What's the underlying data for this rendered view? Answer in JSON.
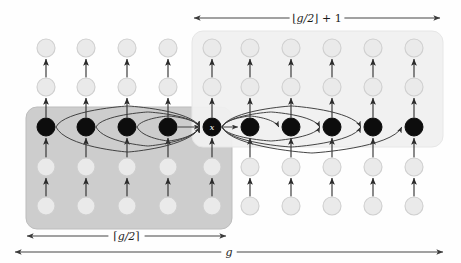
{
  "figure": {
    "background": "#fefefe"
  },
  "colors": {
    "dark_box_fill": "#c9c9c9",
    "dark_box_stroke": "#bdbdbd",
    "light_box_fill": "#f0f0f0",
    "light_box_stroke": "#e6e6e6",
    "active_node_fill": "#0d0d0d",
    "inactive_node_fill": "#eaeaea",
    "inactive_node_stroke": "#cfcfcf",
    "arrow_stroke": "#2b2b2b",
    "arc_stroke": "#3a3a3a",
    "label_text": "#1a1a1a",
    "center_label_text": "#ffffff"
  },
  "measures": [
    {
      "name": "top-measure",
      "label_parts": {
        "bracket_open": "⌊",
        "expr": "g/2",
        "bracket_close": "⌋",
        "suffix": "+ 1"
      },
      "label_text": "⌊g/2⌋ + 1",
      "position": "top",
      "x1": 194,
      "x2": 440,
      "y": 18
    },
    {
      "name": "bottom-left-measure",
      "label_parts": {
        "bracket_open": "⌈",
        "expr": "g/2",
        "bracket_close": "⌉",
        "suffix": ""
      },
      "label_text": "⌈g/2⌉",
      "position": "bottom",
      "x1": 27,
      "x2": 226,
      "y": 236
    },
    {
      "name": "bottom-full-measure",
      "label_parts": {
        "bracket_open": "",
        "expr": "g",
        "bracket_close": "",
        "suffix": ""
      },
      "label_text": "g",
      "position": "bottom",
      "x1": 15,
      "x2": 443,
      "y": 252
    }
  ],
  "boxes": [
    {
      "name": "left-region-box",
      "fill_key": "dark_box_fill",
      "x": 26,
      "y": 107,
      "width": 206,
      "height": 122,
      "radius": 11
    },
    {
      "name": "right-region-box",
      "fill_key": "light_box_fill",
      "x": 192,
      "y": 31,
      "width": 251,
      "height": 116,
      "radius": 11
    }
  ],
  "grid": {
    "rows_y": [
      48,
      87,
      127,
      167,
      206
    ],
    "active_row_index": 2,
    "columns_x": [
      46,
      86,
      127,
      168,
      212,
      250,
      291,
      332,
      373,
      414
    ],
    "node_radius": 9,
    "active_node_radius": 9
  },
  "center_node": {
    "name": "center-node-x",
    "label": "x",
    "x": 212,
    "y": 127
  },
  "columns": [
    {
      "index": 0,
      "x": 46,
      "region": "left",
      "active": true
    },
    {
      "index": 1,
      "x": 86,
      "region": "left",
      "active": true
    },
    {
      "index": 2,
      "x": 127,
      "region": "left",
      "active": true
    },
    {
      "index": 3,
      "x": 168,
      "region": "left",
      "active": true
    },
    {
      "index": 4,
      "x": 212,
      "region": "center",
      "active": true
    },
    {
      "index": 5,
      "x": 250,
      "region": "right",
      "active": true
    },
    {
      "index": 6,
      "x": 291,
      "region": "right",
      "active": true
    },
    {
      "index": 7,
      "x": 332,
      "region": "right",
      "active": true
    },
    {
      "index": 8,
      "x": 373,
      "region": "right",
      "active": true
    },
    {
      "index": 9,
      "x": 414,
      "region": "right",
      "active": true
    }
  ],
  "incoming_arcs": [
    {
      "name": "arc-in-col0-upper",
      "from_x": 46,
      "to_x": 212,
      "bow": -21,
      "side": "upper"
    },
    {
      "name": "arc-in-col1-upper",
      "from_x": 86,
      "to_x": 212,
      "bow": -15,
      "side": "upper"
    },
    {
      "name": "arc-in-col2-upper",
      "from_x": 127,
      "to_x": 212,
      "bow": -11,
      "side": "upper"
    },
    {
      "name": "arc-in-col3-straight",
      "from_x": 168,
      "to_x": 212,
      "bow": 0,
      "side": "straight"
    },
    {
      "name": "arc-in-col2-lower",
      "from_x": 127,
      "to_x": 212,
      "bow": 14,
      "side": "lower"
    },
    {
      "name": "arc-in-col1-lower",
      "from_x": 86,
      "to_x": 212,
      "bow": 19,
      "side": "lower"
    },
    {
      "name": "arc-in-col0-lower",
      "from_x": 46,
      "to_x": 212,
      "bow": 25,
      "side": "lower"
    }
  ],
  "outgoing_arcs": [
    {
      "name": "arc-out-col5-straight",
      "from_x": 212,
      "to_x": 250,
      "bow": 0,
      "side": "straight"
    },
    {
      "name": "arc-out-col6-upper",
      "from_x": 212,
      "to_x": 291,
      "bow": -11,
      "side": "upper"
    },
    {
      "name": "arc-out-col7-upper",
      "from_x": 212,
      "to_x": 332,
      "bow": -15,
      "side": "upper"
    },
    {
      "name": "arc-out-col8-upper",
      "from_x": 212,
      "to_x": 373,
      "bow": -21,
      "side": "upper"
    },
    {
      "name": "arc-out-col7-lower",
      "from_x": 212,
      "to_x": 332,
      "bow": 14,
      "side": "lower"
    },
    {
      "name": "arc-out-col8-lower",
      "from_x": 212,
      "to_x": 373,
      "bow": 20,
      "side": "lower"
    },
    {
      "name": "arc-out-col9-lower",
      "from_x": 212,
      "to_x": 414,
      "bow": 26,
      "side": "lower"
    }
  ],
  "vertical_edges": {
    "description": "upward arrows between consecutive rows in each column",
    "direction": "up"
  }
}
